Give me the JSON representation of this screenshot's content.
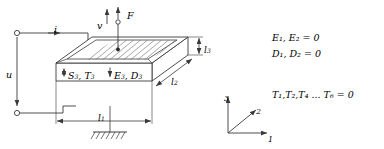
{
  "figure": {
    "colors": {
      "line": "#3a3a3a",
      "hatch": "#6e6e6e",
      "text": "#1a1a1a",
      "background": "#ffffff"
    }
  },
  "electrical": {
    "current_label": "i",
    "voltage_label": "u",
    "terminal_top": "terminal",
    "terminal_bottom": "terminal"
  },
  "mechanical": {
    "velocity_label": "v",
    "force_label": "F"
  },
  "field_labels": {
    "strain_stress": {
      "base1": "S",
      "sub1": "3",
      "sep": ", ",
      "base2": "T",
      "sub2": "3"
    },
    "efield_dflux": {
      "base1": "E",
      "sub1": "3",
      "sep": ", ",
      "base2": "D",
      "sub2": "3"
    }
  },
  "dimensions": {
    "length": {
      "base": "l",
      "sub": "1"
    },
    "depth": {
      "base": "l",
      "sub": "2"
    },
    "thickness": {
      "base": "l",
      "sub": "3"
    }
  },
  "axes": {
    "axis3": "3",
    "axis2": "2",
    "axis1": "1"
  },
  "equations": [
    {
      "id": "eq-e-field",
      "text": "E₁, E₂ = 0"
    },
    {
      "id": "eq-d-flux",
      "text": "D₁, D₂ = 0"
    },
    {
      "id": "eq-stress",
      "text": "T₁,T₂,T₄ ... T₆ = 0"
    }
  ],
  "support": {
    "label": "fixed-ground-hatch"
  }
}
